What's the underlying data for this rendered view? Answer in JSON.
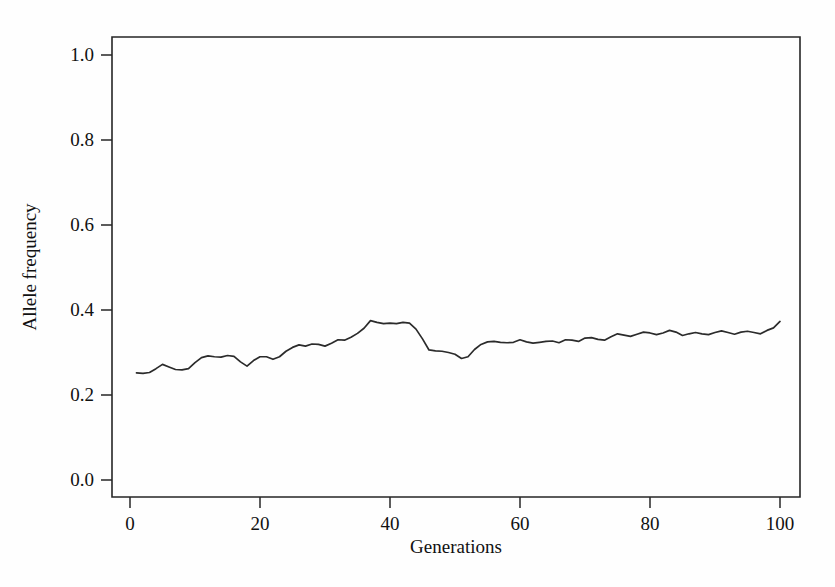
{
  "figure": {
    "background_color": "#fefefe",
    "line_color": "#2b2b2b",
    "axis_color": "#262626"
  },
  "chart_data": {
    "type": "line",
    "title": "",
    "subtitle": "",
    "xlabel": "Generations",
    "ylabel": "Allele frequency",
    "xlim": [
      0,
      100
    ],
    "ylim": [
      0.0,
      1.04
    ],
    "xticks": [
      0,
      20,
      40,
      60,
      80,
      100
    ],
    "xticklabels": [
      "0",
      "20",
      "40",
      "60",
      "80",
      "100"
    ],
    "yticks": [
      0.0,
      0.2,
      0.4,
      0.6,
      0.8,
      1.0
    ],
    "yticklabels": [
      "0.0",
      "0.2",
      "0.4",
      "0.6",
      "0.8",
      "1.0"
    ],
    "grid": false,
    "legend": false,
    "legend_position": "none",
    "annotations": [],
    "series": [
      {
        "name": "Allele frequency trajectory",
        "color": "#2b2b2b",
        "x": [
          1,
          2,
          3,
          4,
          5,
          6,
          7,
          8,
          9,
          10,
          11,
          12,
          13,
          14,
          15,
          16,
          17,
          18,
          19,
          20,
          21,
          22,
          23,
          24,
          25,
          26,
          27,
          28,
          29,
          30,
          31,
          32,
          33,
          34,
          35,
          36,
          37,
          38,
          39,
          40,
          41,
          42,
          43,
          44,
          45,
          46,
          47,
          48,
          49,
          50,
          51,
          52,
          53,
          54,
          55,
          56,
          57,
          58,
          59,
          60,
          61,
          62,
          63,
          64,
          65,
          66,
          67,
          68,
          69,
          70,
          71,
          72,
          73,
          74,
          75,
          76,
          77,
          78,
          79,
          80,
          81,
          82,
          83,
          84,
          85,
          86,
          87,
          88,
          89,
          90,
          91,
          92,
          93,
          94,
          95,
          96,
          97,
          98,
          99,
          100
        ],
        "y": [
          0.252,
          0.251,
          0.253,
          0.262,
          0.272,
          0.266,
          0.26,
          0.259,
          0.262,
          0.276,
          0.288,
          0.292,
          0.29,
          0.289,
          0.293,
          0.291,
          0.278,
          0.268,
          0.281,
          0.29,
          0.29,
          0.284,
          0.29,
          0.303,
          0.312,
          0.318,
          0.315,
          0.32,
          0.319,
          0.315,
          0.322,
          0.33,
          0.329,
          0.336,
          0.345,
          0.357,
          0.375,
          0.371,
          0.368,
          0.369,
          0.368,
          0.371,
          0.369,
          0.355,
          0.332,
          0.306,
          0.304,
          0.303,
          0.3,
          0.296,
          0.286,
          0.29,
          0.307,
          0.319,
          0.325,
          0.326,
          0.324,
          0.323,
          0.324,
          0.33,
          0.325,
          0.322,
          0.324,
          0.326,
          0.327,
          0.323,
          0.33,
          0.329,
          0.326,
          0.334,
          0.335,
          0.331,
          0.329,
          0.337,
          0.344,
          0.341,
          0.338,
          0.343,
          0.348,
          0.346,
          0.342,
          0.346,
          0.352,
          0.348,
          0.34,
          0.344,
          0.347,
          0.344,
          0.342,
          0.347,
          0.351,
          0.347,
          0.343,
          0.348,
          0.35,
          0.347,
          0.344,
          0.352,
          0.358,
          0.373
        ]
      }
    ]
  }
}
